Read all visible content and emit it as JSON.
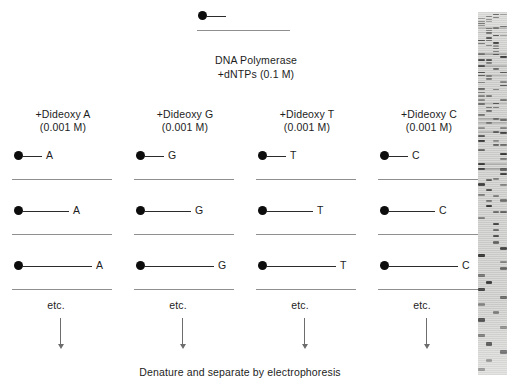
{
  "figure": {
    "title_text": "",
    "caption": "Denature and separate by electrophoresis",
    "enzyme_label_line1": "DNA Polymerase",
    "enzyme_label_line2": "+dNTPs (0.1 M)",
    "etc_label": "etc.",
    "gel_label": "sequencing-gel-autoradiograph"
  },
  "colors": {
    "primer_stroke": "#2b2b2b",
    "template_stroke": "#8f8f8f",
    "dot_fill": "#0d0d0d",
    "arrow_stroke": "#6d6d6d",
    "text": "#1d1d1d",
    "gel_background": "#d8d8d6",
    "gel_band": "#2e2e2e",
    "page_background": "#ffffff"
  },
  "columns": [
    {
      "id": "col-a",
      "header_line1": "+Dideoxy A",
      "header_line2": "(0.001 M)",
      "terminator_base": "A",
      "etc_label": "etc.",
      "rows": [
        {
          "base": "A",
          "primer_length": 20
        },
        {
          "base": "A",
          "primer_length": 47
        },
        {
          "base": "A",
          "primer_length": 70
        }
      ]
    },
    {
      "id": "col-g",
      "header_line1": "+Dideoxy G",
      "header_line2": "(0.001 M)",
      "terminator_base": "G",
      "etc_label": "etc.",
      "rows": [
        {
          "base": "G",
          "primer_length": 20
        },
        {
          "base": "G",
          "primer_length": 47
        },
        {
          "base": "G",
          "primer_length": 70
        }
      ]
    },
    {
      "id": "col-t",
      "header_line1": "+Dideoxy T",
      "header_line2": "(0.001 M)",
      "terminator_base": "T",
      "etc_label": "etc.",
      "rows": [
        {
          "base": "T",
          "primer_length": 20
        },
        {
          "base": "T",
          "primer_length": 47
        },
        {
          "base": "T",
          "primer_length": 70
        }
      ]
    },
    {
      "id": "col-c",
      "header_line1": "+Dideoxy C",
      "header_line2": "(0.001 M)",
      "terminator_base": "C",
      "etc_label": "etc.",
      "rows": [
        {
          "base": "C",
          "primer_length": 20
        },
        {
          "base": "C",
          "primer_length": 47
        },
        {
          "base": "C",
          "primer_length": 70
        }
      ]
    }
  ],
  "top_reaction": {
    "primer_length": 22,
    "template_length": 93
  }
}
